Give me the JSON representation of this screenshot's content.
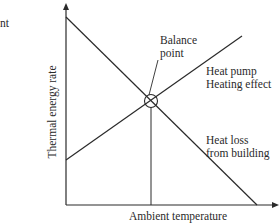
{
  "diagram": {
    "fragment_text": "nt",
    "y_axis_label": "Thermal energy rate",
    "x_axis_label": "Ambient temperature",
    "balance_point": {
      "line1": "Balance",
      "line2": "point"
    },
    "heat_pump": {
      "line1": "Heat pump",
      "line2": "Heating effect"
    },
    "heat_loss": {
      "line1": "Heat loss",
      "line2": "from building"
    },
    "colors": {
      "line": "#2a2a2a",
      "background": "#ffffff"
    }
  }
}
